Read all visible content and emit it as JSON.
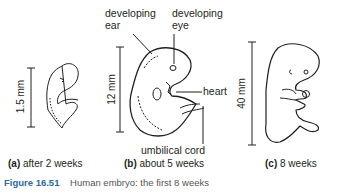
{
  "figure": {
    "number": "Figure 16.51",
    "title": "Human embryo: the first 8 weeks"
  },
  "panels": [
    {
      "id": "a",
      "letter": "(a)",
      "label": "after 2 weeks",
      "scale": "1.5 mm"
    },
    {
      "id": "b",
      "letter": "(b)",
      "label": "about 5 weeks",
      "scale": "12 mm",
      "annotations": [
        "developing ear",
        "developing eye",
        "heart",
        "umbilical cord"
      ]
    },
    {
      "id": "c",
      "letter": "(c)",
      "label": "8 weeks",
      "scale": "40 mm"
    }
  ],
  "annotations": {
    "ear_line1": "developing",
    "ear_line2": "ear",
    "eye_line1": "developing",
    "eye_line2": "eye",
    "heart": "heart",
    "cord": "umbilical cord"
  },
  "colors": {
    "figure_number": "#2a6a9e",
    "line": "#231f20"
  }
}
